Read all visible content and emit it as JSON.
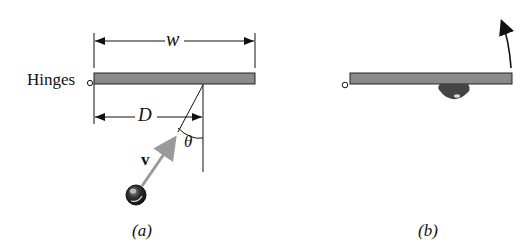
{
  "panels": [
    {
      "caption": "(a)",
      "labels": {
        "hinges": "Hinges",
        "width": "w",
        "distance": "D",
        "velocity": "v",
        "angle": "θ"
      }
    },
    {
      "caption": "(b)"
    }
  ],
  "colors": {
    "plate_fill": "#8a8a8a",
    "plate_stroke": "#222222",
    "velocity_arrow": "#9a9a9a",
    "ink": "#111111",
    "blob": "#444444"
  },
  "icons": {
    "hinge": "open-circle",
    "ball": "sphere",
    "rotation_arrow": "curved-arrow-up"
  }
}
